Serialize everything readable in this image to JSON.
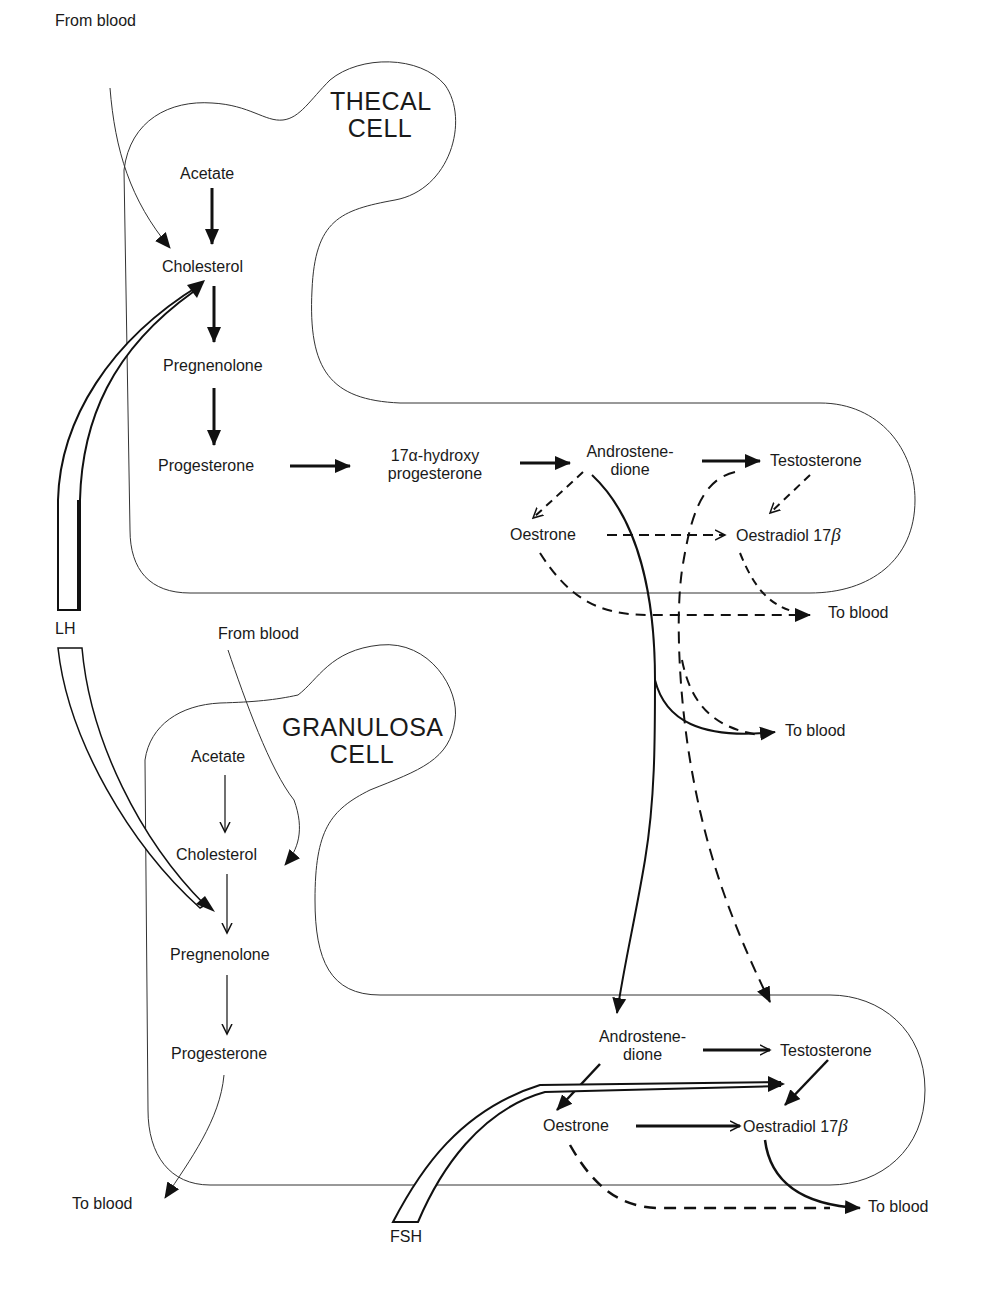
{
  "diagram": {
    "thecal_cell": {
      "title_line1": "THECAL",
      "title_line2": "CELL",
      "from_blood": "From blood",
      "acetate": "Acetate",
      "cholesterol": "Cholesterol",
      "pregnenolone": "Pregnenolone",
      "progesterone": "Progesterone",
      "hydroxy_line1": "17α-hydroxy",
      "hydroxy_line2": "progesterone",
      "androstenedione_line1": "Androstene-",
      "androstenedione_line2": "dione",
      "testosterone": "Testosterone",
      "oestrone": "Oestrone",
      "oestradiol": "Oestradiol 17",
      "oestradiol_suffix": "β",
      "to_blood": "To blood"
    },
    "middle": {
      "to_blood": "To blood",
      "lh": "LH"
    },
    "granulosa_cell": {
      "title_line1": "GRANULOSA",
      "title_line2": "CELL",
      "from_blood": "From blood",
      "acetate": "Acetate",
      "cholesterol": "Cholesterol",
      "pregnenolone": "Pregnenolone",
      "progesterone": "Progesterone",
      "to_blood_left": "To blood",
      "androstenedione_line1": "Androstene-",
      "androstenedione_line2": "dione",
      "testosterone": "Testosterone",
      "oestrone": "Oestrone",
      "oestradiol": "Oestradiol 17",
      "oestradiol_suffix": "β",
      "to_blood_right": "To blood",
      "fsh": "FSH"
    }
  }
}
